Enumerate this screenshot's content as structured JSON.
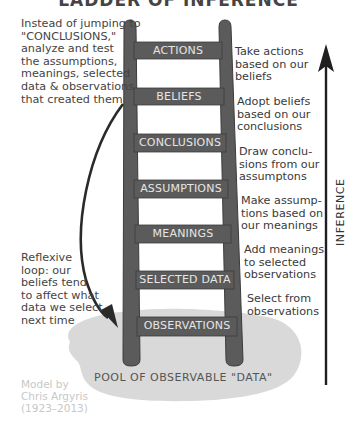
{
  "title": "LADDER OF INFERENCE",
  "left_notes": {
    "top": [
      "Instead of jumping to",
      "\"CONCLUSIONS,\"",
      "analyze and test",
      "the assumptions,",
      "meanings, selected",
      "data & observations",
      "that created them"
    ],
    "bottom": [
      "Reflexive",
      "loop: our",
      "beliefs tend",
      "to affect what",
      "data we select",
      "next time"
    ]
  },
  "rungs": [
    {
      "label": "ACTIONS",
      "description": [
        "Take actions",
        "based on our",
        "beliefs"
      ]
    },
    {
      "label": "BELIEFS",
      "description": [
        "Adopt beliefs",
        "based on our",
        "conclusions"
      ]
    },
    {
      "label": "CONCLUSIONS",
      "description": [
        "Draw conclu-",
        "sions from our",
        "assumptons"
      ]
    },
    {
      "label": "ASSUMPTIONS",
      "description": [
        "Make assump-",
        "tions based on",
        "our meanings"
      ]
    },
    {
      "label": "MEANINGS",
      "description": [
        "Add meanings",
        "to selected",
        "observations"
      ]
    },
    {
      "label": "SELECTED DATA",
      "description": [
        "Select from",
        "observations"
      ]
    },
    {
      "label": "OBSERVATIONS",
      "description": []
    }
  ],
  "pool_label": "POOL OF OBSERVABLE \"DATA\"",
  "axis_label": "INFERENCE",
  "credit": [
    "Model by",
    "Chris Argyris",
    "(1923–2013)"
  ],
  "colors": {
    "ladder": "#5b5b5b",
    "ladder_outline": "#3c3c3c",
    "pool": "#d9d9d9",
    "arrow": "#2a2a2a",
    "rung_text": "#e6e6e6"
  }
}
